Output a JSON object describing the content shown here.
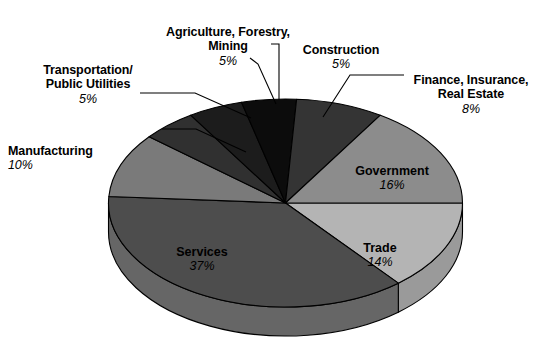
{
  "chart_data": {
    "type": "pie",
    "title": "",
    "subtitle": "",
    "xlabel": "",
    "ylabel": "",
    "legend_position": "none",
    "grid": false,
    "categories": [
      "Trade",
      "Services",
      "Manufacturing",
      "Transportation/\nPublic Utilities",
      "Agriculture, Forestry,\nMining",
      "Construction",
      "Finance, Insurance,\nReal Estate",
      "Government"
    ],
    "values": [
      14,
      37,
      10,
      5,
      5,
      5,
      8,
      16
    ],
    "unit": "%",
    "total": 100,
    "slices": [
      {
        "name": "Trade",
        "label": "Trade",
        "value": 14,
        "percent_text": "14%",
        "color": "#b4b4b4",
        "side_color": "#9a9a9a",
        "label_placement": "inside"
      },
      {
        "name": "Services",
        "label": "Services",
        "value": 37,
        "percent_text": "37%",
        "color": "#4d4d4d",
        "side_color": "#666666",
        "label_placement": "inside"
      },
      {
        "name": "Manufacturing",
        "label": "Manufacturing",
        "value": 10,
        "percent_text": "10%",
        "color": "#7a7a7a",
        "side_color": "#8e8e8e",
        "label_placement": "outside"
      },
      {
        "name": "Transportation/Public Utilities",
        "label": "Transportation/\nPublic Utilities",
        "value": 5,
        "percent_text": "5%",
        "color": "#303030",
        "side_color": "#3a3a3a",
        "label_placement": "outside"
      },
      {
        "name": "Agriculture, Forestry, Mining",
        "label": "Agriculture, Forestry,\nMining",
        "value": 5,
        "percent_text": "5%",
        "color": "#1c1c1c",
        "side_color": "#262626",
        "label_placement": "outside"
      },
      {
        "name": "Construction",
        "label": "Construction",
        "value": 5,
        "percent_text": "5%",
        "color": "#0c0c0c",
        "side_color": "#161616",
        "label_placement": "outside"
      },
      {
        "name": "Finance, Insurance, Real Estate",
        "label": "Finance, Insurance,\nReal Estate",
        "value": 8,
        "percent_text": "8%",
        "color": "#343434",
        "side_color": "#404040",
        "label_placement": "outside"
      },
      {
        "name": "Government",
        "label": "Government",
        "value": 16,
        "percent_text": "16%",
        "color": "#8c8c8c",
        "side_color": "#7d7d7d",
        "label_placement": "inside"
      }
    ]
  },
  "labels": {
    "agriculture": {
      "name": "Agriculture, Forestry,\nMining",
      "pct": "5%"
    },
    "transportation": {
      "name": "Transportation/\nPublic Utilities",
      "pct": "5%"
    },
    "manufacturing": {
      "name": "Manufacturing",
      "pct": "10%"
    },
    "construction": {
      "name": "Construction",
      "pct": "5%"
    },
    "finance": {
      "name": "Finance, Insurance,\nReal Estate",
      "pct": "8%"
    },
    "government": {
      "name": "Government",
      "pct": "16%"
    },
    "trade": {
      "name": "Trade",
      "pct": "14%"
    },
    "services": {
      "name": "Services",
      "pct": "37%"
    }
  },
  "colors": {
    "background": "#ffffff",
    "text": "#000000",
    "outline": "#000000",
    "leader_line": "#000000"
  }
}
